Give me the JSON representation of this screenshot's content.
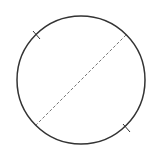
{
  "diagram": {
    "type": "geometry",
    "circle": {
      "cx": 81,
      "cy": 80,
      "r": 64,
      "stroke": "#333333",
      "stroke_width": 1.5
    },
    "diameter": {
      "x1": 126,
      "y1": 35,
      "x2": 36,
      "y2": 125,
      "stroke": "#777777",
      "dash": "3,2"
    },
    "ticks": [
      {
        "name": "upper-left",
        "x1": 33,
        "y1": 31,
        "x2": 40,
        "y2": 39
      },
      {
        "name": "lower-right",
        "x1": 123,
        "y1": 124,
        "x2": 130,
        "y2": 132
      }
    ],
    "labels": []
  }
}
